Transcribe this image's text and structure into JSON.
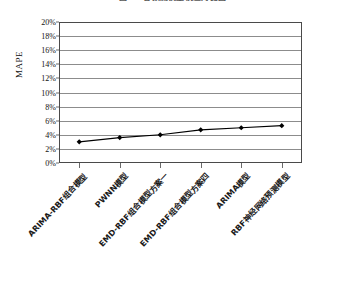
{
  "chart_data": {
    "type": "line",
    "title": "图 5-2  各预测模型误差对比图",
    "categories": [
      "ARIMA-RBF组合模型",
      "PWNN模型",
      "EMD-RBF组合模型方案一",
      "EMD-RBF组合模型方案四",
      "ARIMA模型",
      "RBF神经网络预测模型"
    ],
    "values": [
      3.0,
      3.6,
      4.0,
      4.7,
      5.0,
      5.3
    ],
    "series": [
      {
        "name": "MAPE",
        "values": [
          3.0,
          3.6,
          4.0,
          4.7,
          5.0,
          5.3
        ]
      }
    ],
    "xlabel": "",
    "ylabel": "MAPE",
    "ylim": [
      0,
      20
    ],
    "ytick_step": 2,
    "ytick_labels": [
      "20%",
      "18%",
      "16%",
      "14%",
      "12%",
      "10%",
      "8%",
      "6%",
      "4%",
      "2%",
      "0%"
    ],
    "ytick_values": [
      20,
      18,
      16,
      14,
      12,
      10,
      8,
      6,
      4,
      2,
      0
    ],
    "grid": true,
    "legend": false,
    "legend_position": "none",
    "marker": "diamond",
    "marker_color": "#000000",
    "line_color": "#000000",
    "frame_color": "#4a4a4a",
    "grid_color": "#8c8c8c",
    "background": "#ffffff"
  }
}
